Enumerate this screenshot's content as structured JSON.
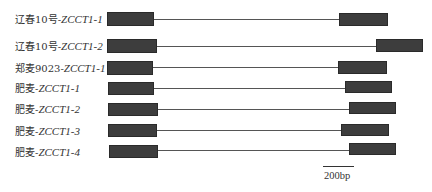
{
  "figure": {
    "type": "gene-structure",
    "exon_color": "#3d3d3d",
    "intron_color": "#555555",
    "scale_bar": {
      "label": "200bp"
    }
  },
  "rows": [
    {
      "prefix": "辽春10号-",
      "gene": "ZCCT1-1"
    },
    {
      "prefix": "辽春10号-",
      "gene": "ZCCT1-2"
    },
    {
      "prefix": "郑麦9023-",
      "gene": "ZCCT1-1"
    },
    {
      "prefix": "肥麦-",
      "gene": "ZCCT1-1"
    },
    {
      "prefix": "肥麦-",
      "gene": "ZCCT1-2"
    },
    {
      "prefix": "肥麦-",
      "gene": "ZCCT1-3"
    },
    {
      "prefix": "肥麦-",
      "gene": "ZCCT1-4"
    }
  ]
}
